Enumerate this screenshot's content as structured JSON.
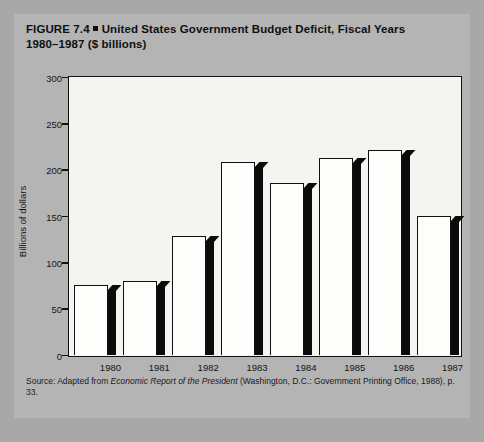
{
  "figure": {
    "label": "FIGURE 7.4",
    "title_line1": "United States Government Budget Deficit, Fiscal Years",
    "title_line2": "1980–1987 ($ billions)",
    "source_prefix": "Source: Adapted from ",
    "source_italic": "Economic Report of the President",
    "source_suffix": " (Washington, D.C.: Government Printing Office, 1988), p. 33."
  },
  "chart_data": {
    "type": "bar",
    "categories": [
      "1980",
      "1981",
      "1982",
      "1983",
      "1984",
      "1985",
      "1986",
      "1987"
    ],
    "values": [
      75,
      79,
      128,
      208,
      185,
      212,
      221,
      150
    ],
    "xlabel": "",
    "ylabel": "Billions of dollars",
    "ylim": [
      0,
      300
    ],
    "yticks": [
      0,
      50,
      100,
      150,
      200,
      250,
      300
    ],
    "ytick_labels": [
      "0",
      "50",
      "100",
      "150",
      "200",
      "250",
      "300"
    ],
    "grid": false,
    "legend": "none",
    "series_style": "3d-shadow-bar",
    "bar_face_color": "#fdfdfb",
    "bar_shadow_color": "#0b0b0b",
    "plot_background": "#f4f4f0",
    "figure_background": "#b4b4b4"
  }
}
